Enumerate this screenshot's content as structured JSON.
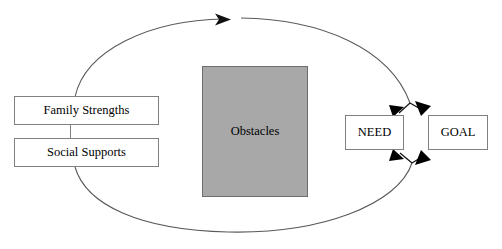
{
  "diagram": {
    "colors": {
      "obstacles_fill": "#a8a8a8",
      "obstacles_stroke": "#6e6e6e",
      "box_stroke": "#808080",
      "line_stroke": "#595959",
      "arrow_fill": "#000000",
      "text": "#000000",
      "background": "#ffffff"
    },
    "nodes": [
      {
        "id": "family_strengths",
        "label": "Family Strengths",
        "shape": "rectangle",
        "fill": "white"
      },
      {
        "id": "social_supports",
        "label": "Social Supports",
        "shape": "rectangle",
        "fill": "white"
      },
      {
        "id": "obstacles",
        "label": "Obstacles",
        "shape": "rectangle",
        "fill": "gray"
      },
      {
        "id": "need",
        "label": "NEED",
        "shape": "rectangle",
        "fill": "white"
      },
      {
        "id": "goal",
        "label": "GOAL",
        "shape": "rectangle",
        "fill": "white"
      }
    ],
    "connectors": [
      {
        "id": "left_stack_link",
        "from": "family_strengths",
        "to": "social_supports",
        "type": "line"
      },
      {
        "id": "outer_loop",
        "type": "ellipse-arc",
        "arrowheads": 5
      },
      {
        "id": "need_goal_top",
        "type": "double-arrow",
        "between": [
          "need",
          "goal"
        ]
      },
      {
        "id": "need_goal_bottom",
        "type": "double-arrow",
        "between": [
          "need",
          "goal"
        ]
      }
    ]
  }
}
